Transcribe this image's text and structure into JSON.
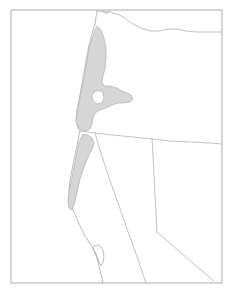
{
  "figure": {
    "caption": "",
    "background_color": "#ffffff",
    "frame_color": "#9a9a9a",
    "width_px": 233,
    "height_px": 294
  },
  "legend": {
    "visible": false,
    "entries": [
      {
        "label": "Highlighted coastal region",
        "color": "#d6d6d6",
        "outline_color": "#b0b0b0"
      }
    ]
  },
  "layers": [
    {
      "name": "map-frame",
      "type": "rectangle",
      "stroke": "#9a9a9a",
      "fill": "none"
    },
    {
      "name": "national-and-state-boundaries",
      "type": "polyline-set",
      "stroke": "#a8a8a8",
      "fill": "none"
    },
    {
      "name": "coastline",
      "type": "polyline",
      "stroke": "#a0a0a0",
      "fill": "none"
    },
    {
      "name": "highlighted-region",
      "type": "polygon-with-hole",
      "stroke": "#b0b0b0",
      "fill": "#d6d6d6"
    }
  ],
  "geometry": {
    "frame": {
      "x": 11,
      "y": 10,
      "width": 211,
      "height": 273
    },
    "northern_border": "M 97,11 L 110,12 L 120,15 L 126,19 L 133,24 L 141,28 L 150,31 L 159,31 L 168,29 L 177,29 L 186,31 L 196,32 L 206,32 L 216,32 L 222,32",
    "northern_border_notch": "M 103,11 L 104,13 L 108,13 L 109,11",
    "washington_oregon_pacific_edge": "M 97,11 L 96,17 L 95,24",
    "oregon_california_line": "M 80,131 L 95,133 L 112,135 L 133,137 L 152,139 L 170,141 L 190,142 L 210,143 L 222,144",
    "nevada_west_line": "M 95,133 L 100,150 L 108,175 L 117,200 L 126,226 L 135,251 L 143,274 L 146,283",
    "idaho_nevada_corner_line": "M 152,139 L 153,155 L 154,175 L 155,196 L 156,214 L 157,232",
    "nevada_arizona_line": "M 157,232 L 172,245 L 187,258 L 202,271 L 214,281",
    "nevada_utah_line": "M 157,139 L 157,232",
    "oregon_idaho_line": "M 155,40 L 156,60 L 157,80 L 156,100 L 155,118 L 154,132",
    "coastline": "M 95,24 L 92,34 L 89,45 L 87,56 L 85,67 L 83,78 L 81,89 L 79,100 L 77,110 L 76,120 L 78,128 L 80,131 L 78,140 L 76,150 L 74,160 L 72,170 L 70,180 L 69,190 L 70,200 L 73,210 L 77,219 L 81,228 L 85,236 L 89,242 L 93,248 L 96,255 L 98,262 L 100,270 L 102,278 L 103,283",
    "bay_detail": "M 93,248 L 95,252 L 97,257 L 99,262 L 101,266 L 103,262 L 104,256 L 103,250 L 100,246 L 97,245 L 94,246 Z",
    "region_outer": "M 97,26 L 101,30 L 104,38 L 106,48 L 106,58 L 105,68 L 103,76 L 102,82 L 104,86 L 110,86 L 117,88 L 122,91 L 127,93 L 131,95 L 133,99 L 130,102 L 124,103 L 118,103 L 112,105 L 106,108 L 100,110 L 95,113 L 93,118 L 92,124 L 90,129 L 86,131 L 81,130 L 78,127 L 76,121 L 77,113 L 79,103 L 81,93 L 83,82 L 85,71 L 87,60 L 89,49 L 92,38 L 95,30 Z",
    "region_hole": "M 94,92 L 99,90 L 103,93 L 104,98 L 102,103 L 97,104 L 93,101 L 92,96 Z",
    "region_lower": "M 83,134 L 88,135 L 92,138 L 94,143 L 92,149 L 89,155 L 86,162 L 83,170 L 80,179 L 78,188 L 76,197 L 74,205 L 72,210 L 69,208 L 68,201 L 69,192 L 71,182 L 73,172 L 75,162 L 77,152 L 79,142 Z"
  },
  "annotations": []
}
